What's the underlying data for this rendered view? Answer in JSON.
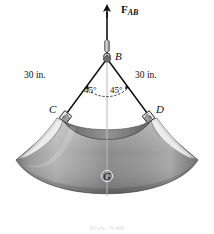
{
  "figure": {
    "background_color": "#ffffff"
  },
  "labels": {
    "force": {
      "symbol": "F",
      "subscript": "AB",
      "name": "force-FAB"
    },
    "point_b": "B",
    "point_c": "C",
    "point_d": "D",
    "point_g": "G",
    "dim_left": "30 in.",
    "dim_right": "30 in.",
    "angle_left": "45°",
    "angle_right": "45°"
  },
  "caption": "Prob. 3-68",
  "colors": {
    "line": "#1a1a1a",
    "plate_light": "#d9d9d9",
    "plate_mid": "#8c8c8c",
    "plate_dark": "#6e6e6e",
    "edge_highlight": "#f2f2f2",
    "centerline": "#b4b4b4",
    "metal": "#a8a8a8"
  },
  "geometry": {
    "arrow_tip": [
      107,
      6
    ],
    "point_b": [
      107,
      57
    ],
    "point_c": [
      63,
      116
    ],
    "point_d": [
      150,
      116
    ],
    "point_g": [
      107,
      176
    ],
    "angle_value_deg": 45,
    "cable_length_in": 30
  }
}
